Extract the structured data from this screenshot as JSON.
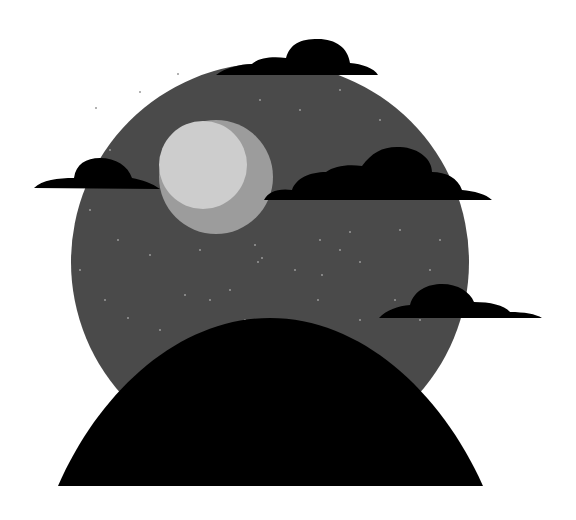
{
  "scene": {
    "title": "Night sky illustration",
    "background": "#ffffff",
    "sky": {
      "cx": 270,
      "cy": 262,
      "r": 199,
      "color": "#4a4a4a"
    },
    "moon": {
      "outer": {
        "cx": 216,
        "cy": 177,
        "r": 57,
        "color": "#9c9c9c"
      },
      "inner": {
        "cx": 203,
        "cy": 165,
        "r": 44,
        "color": "#cdcdcd"
      }
    },
    "hill": {
      "color": "#000000"
    },
    "clouds": [
      {
        "name": "cloud-top",
        "color": "#000000"
      },
      {
        "name": "cloud-left",
        "color": "#000000"
      },
      {
        "name": "cloud-middle-right",
        "color": "#000000"
      },
      {
        "name": "cloud-lower-right",
        "color": "#000000"
      }
    ],
    "stars": [
      [
        96,
        108
      ],
      [
        140,
        92
      ],
      [
        178,
        74
      ],
      [
        110,
        150
      ],
      [
        90,
        210
      ],
      [
        118,
        240
      ],
      [
        150,
        255
      ],
      [
        230,
        215
      ],
      [
        255,
        245
      ],
      [
        258,
        262
      ],
      [
        262,
        258
      ],
      [
        295,
        270
      ],
      [
        320,
        240
      ],
      [
        340,
        250
      ],
      [
        350,
        232
      ],
      [
        322,
        275
      ],
      [
        360,
        262
      ],
      [
        318,
        300
      ],
      [
        210,
        300
      ],
      [
        230,
        290
      ],
      [
        105,
        300
      ],
      [
        128,
        318
      ],
      [
        160,
        330
      ],
      [
        245,
        320
      ],
      [
        290,
        322
      ],
      [
        360,
        320
      ],
      [
        395,
        300
      ],
      [
        400,
        230
      ],
      [
        440,
        240
      ],
      [
        430,
        270
      ],
      [
        380,
        120
      ],
      [
        410,
        150
      ],
      [
        300,
        110
      ],
      [
        340,
        90
      ],
      [
        260,
        100
      ],
      [
        200,
        250
      ],
      [
        185,
        295
      ],
      [
        80,
        270
      ],
      [
        420,
        320
      ],
      [
        455,
        300
      ]
    ]
  }
}
